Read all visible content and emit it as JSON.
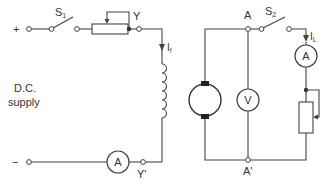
{
  "diagram": {
    "type": "circuit-schematic",
    "title": "",
    "colors": {
      "line": "#444444",
      "text": "#333333",
      "background": "#ffffff"
    },
    "labels": {
      "plus": "+",
      "minus": "−",
      "supply_line1": "D.C.",
      "supply_line2": "supply",
      "switch1": "S",
      "switch1_sub": "1",
      "switch2": "S",
      "switch2_sub": "2",
      "node_y": "Y",
      "node_y_prime": "Y'",
      "node_a": "A",
      "node_a_prime": "A'",
      "field_current": "I",
      "field_current_sub": "f",
      "load_current": "I",
      "load_current_sub": "L",
      "ammeter_field": "A",
      "ammeter_load": "A",
      "voltmeter": "V"
    },
    "components": [
      {
        "id": "dc-supply",
        "kind": "DC supply terminals",
        "label": "D.C. supply"
      },
      {
        "id": "s1",
        "kind": "switch",
        "label": "S1"
      },
      {
        "id": "field-rheostat",
        "kind": "variable resistor"
      },
      {
        "id": "field-winding",
        "kind": "inductor coil",
        "between": [
          "Y",
          "Y'"
        ]
      },
      {
        "id": "field-ammeter",
        "kind": "ammeter",
        "label": "A"
      },
      {
        "id": "generator",
        "kind": "DC machine armature",
        "between": [
          "A",
          "A'"
        ]
      },
      {
        "id": "voltmeter",
        "kind": "voltmeter",
        "label": "V"
      },
      {
        "id": "s2",
        "kind": "switch",
        "label": "S2"
      },
      {
        "id": "load-ammeter",
        "kind": "ammeter",
        "label": "A"
      },
      {
        "id": "load-rheostat",
        "kind": "variable resistor"
      }
    ]
  }
}
